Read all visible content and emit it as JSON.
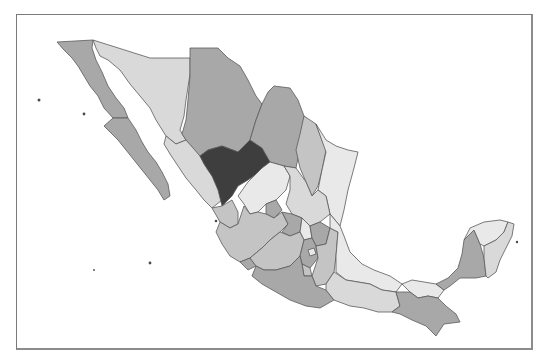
{
  "map": {
    "type": "choropleth",
    "subject": "Mexico states",
    "palette": {
      "dark": "#3e3e3e",
      "medium": "#a8a8a8",
      "medium_light": "#c4c4c4",
      "light": "#d9d9d9",
      "very_light": "#e9e9e9",
      "border": "#5a5a5a",
      "frame": "#7a7a7a"
    },
    "regions": [
      {
        "name": "Baja California",
        "shade": "medium",
        "points": "57,42 93,40 92,48 96,60 102,72 108,86 116,98 124,108 128,118 113,118 104,108 98,96 90,86 84,76 78,66 72,58 64,50"
      },
      {
        "name": "Baja California Sur",
        "shade": "medium",
        "points": "113,118 128,118 136,130 142,142 148,152 156,162 162,172 168,184 170,196 164,200 158,190 150,180 142,170 134,160 126,150 118,140 110,132 104,126"
      },
      {
        "name": "Sonora",
        "shade": "light",
        "points": "93,40 150,58 190,58 190,74 186,100 184,116 180,130 186,140 176,144 166,136 156,120 150,108 140,96 130,84 120,70 108,60 100,56 96,48"
      },
      {
        "name": "Chihuahua",
        "shade": "medium",
        "points": "190,58 190,48 218,48 228,58 240,66 248,80 256,96 262,104 256,120 250,140 238,152 222,146 208,150 200,156 190,146 182,134 186,120 188,100 190,76"
      },
      {
        "name": "Coahuila",
        "shade": "medium",
        "points": "262,104 268,92 274,86 290,88 298,100 304,116 310,124 304,134 300,148 296,168 284,166 270,162 262,168 254,156 250,140 256,120"
      },
      {
        "name": "Nuevo Leon",
        "shade": "medium_light",
        "points": "304,116 316,124 322,140 326,150 322,170 318,186 312,196 306,182 300,168 296,150 300,134"
      },
      {
        "name": "Tamaulipas",
        "shade": "very_light",
        "points": "316,124 326,140 336,146 348,150 358,152 354,168 348,190 344,210 340,226 330,214 326,196 318,190 322,170 326,152"
      },
      {
        "name": "Sinaloa",
        "shade": "light",
        "points": "166,136 176,144 186,140 200,156 208,170 218,184 222,200 212,208 204,200 196,190 186,178 178,166 170,154 164,144"
      },
      {
        "name": "Durango",
        "shade": "dark",
        "points": "222,146 238,152 250,140 262,148 270,162 262,170 248,180 238,186 232,196 222,206 218,190 212,176 204,164 200,156 208,150"
      },
      {
        "name": "Zacatecas",
        "shade": "very_light",
        "points": "262,168 270,162 284,166 290,176 286,190 276,200 266,204 258,212 250,214 244,204 238,196 248,182"
      },
      {
        "name": "San Luis Potosi",
        "shade": "light",
        "points": "284,166 296,168 306,182 312,196 318,190 326,196 330,214 320,222 310,226 302,218 292,214 286,204 290,190 290,176"
      },
      {
        "name": "Nayarit",
        "shade": "medium_light",
        "points": "212,208 222,206 232,200 238,212 238,224 230,228 220,222"
      },
      {
        "name": "Aguascalientes",
        "shade": "medium",
        "points": "266,204 276,200 282,210 274,218 266,214"
      },
      {
        "name": "Jalisco",
        "shade": "medium_light",
        "points": "220,222 230,228 238,224 244,206 250,214 258,212 266,214 274,218 282,212 288,224 280,232 270,240 262,248 250,258 240,262 230,256 222,244 216,232"
      },
      {
        "name": "Colima",
        "shade": "medium",
        "points": "240,262 250,258 256,266 248,270"
      },
      {
        "name": "Guanajuato",
        "shade": "medium",
        "points": "282,212 292,214 302,218 300,232 290,236 282,232 288,224"
      },
      {
        "name": "Queretaro",
        "shade": "very_light",
        "points": "302,218 310,226 312,238 304,240 300,232"
      },
      {
        "name": "Hidalgo",
        "shade": "medium",
        "points": "310,226 320,222 330,228 326,244 316,246 312,238"
      },
      {
        "name": "Michoacan",
        "shade": "medium_light",
        "points": "262,248 270,240 280,232 290,236 300,232 304,240 300,256 290,266 276,270 264,270 256,266 250,258"
      },
      {
        "name": "Mexico",
        "shade": "medium",
        "points": "300,256 304,240 312,238 316,246 318,258 310,268 302,264"
      },
      {
        "name": "Distrito Federal",
        "shade": "very_light",
        "points": "308,250 314,248 316,254 310,256"
      },
      {
        "name": "Morelos",
        "shade": "medium_light",
        "points": "302,264 310,268 312,276 304,276"
      },
      {
        "name": "Tlaxcala",
        "shade": "light",
        "points": "322,246 330,246 330,252 322,252"
      },
      {
        "name": "Puebla",
        "shade": "medium_light",
        "points": "316,246 326,244 330,228 338,232 336,256 334,272 326,284 316,286 312,276 318,258"
      },
      {
        "name": "Guerrero",
        "shade": "medium",
        "points": "256,266 264,270 276,270 290,266 300,256 302,264 304,276 312,276 316,286 326,290 334,300 320,308 306,306 290,300 276,292 262,284 252,276"
      },
      {
        "name": "Veracruz",
        "shade": "very_light",
        "points": "330,214 340,226 344,236 350,252 362,264 374,270 390,276 402,284 396,292 382,290 370,284 358,282 346,280 336,272 336,256 338,232 330,228"
      },
      {
        "name": "Oaxaca",
        "shade": "light",
        "points": "326,284 334,272 346,280 358,282 370,284 382,290 396,292 400,306 392,312 378,312 364,308 350,306 334,300 326,290"
      },
      {
        "name": "Tabasco",
        "shade": "very_light",
        "points": "402,284 412,280 424,282 436,284 444,290 438,298 428,296 418,298 410,292"
      },
      {
        "name": "Chiapas",
        "shade": "medium",
        "points": "396,292 410,292 418,298 428,296 438,298 446,306 456,314 460,322 444,324 436,336 426,326 412,320 400,314 392,312 400,306"
      },
      {
        "name": "Campeche",
        "shade": "medium",
        "points": "436,284 448,278 458,268 462,254 464,240 474,230 480,244 484,258 486,276 476,278 460,278 450,286 444,290"
      },
      {
        "name": "Yucatan",
        "shade": "very_light",
        "points": "464,240 470,228 484,222 500,220 508,222 504,232 496,240 484,246 480,244 474,230"
      },
      {
        "name": "Quintana Roo",
        "shade": "light",
        "points": "484,246 496,240 504,232 508,222 514,224 512,236 506,248 500,260 496,272 488,278 486,276 484,258"
      }
    ],
    "islands": [
      {
        "name": "Isla Guadalupe",
        "cx": 39,
        "cy": 100,
        "r": 1.5
      },
      {
        "name": "Isla Cedros",
        "cx": 84,
        "cy": 114,
        "r": 1.4
      },
      {
        "name": "Islas Marias",
        "cx": 216,
        "cy": 221,
        "r": 1.3
      },
      {
        "name": "Revillagigedo 1",
        "cx": 150,
        "cy": 263,
        "r": 1.4
      },
      {
        "name": "Revillagigedo 2",
        "cx": 94,
        "cy": 270,
        "r": 0.9
      },
      {
        "name": "Cozumel",
        "cx": 517,
        "cy": 242,
        "r": 1.2
      }
    ]
  }
}
